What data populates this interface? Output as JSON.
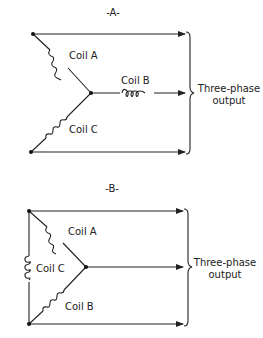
{
  "diagrams": [
    {
      "id": "A",
      "title": "-A-",
      "configuration": "wye",
      "coils": {
        "a": "Coil A",
        "b": "Coil B",
        "c": "Coil C"
      },
      "output_label_line1": "Three-phase",
      "output_label_line2": "output"
    },
    {
      "id": "B",
      "title": "-B-",
      "configuration": "delta",
      "coils": {
        "a": "Coil A",
        "b": "Coil B",
        "c": "Coil C"
      },
      "output_label_line1": "Three-phase",
      "output_label_line2": "output"
    }
  ],
  "colors": {
    "line": "#222222",
    "background": "#ffffff"
  }
}
